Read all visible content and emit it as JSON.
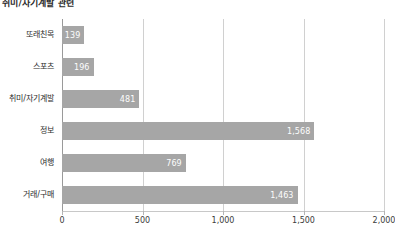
{
  "title": "취미/자기계발 관련",
  "chart_data": {
    "type": "bar",
    "orientation": "horizontal",
    "title": "취미/자기계발 관련",
    "xlabel": "",
    "ylabel": "",
    "categories": [
      "또래친목",
      "스포츠",
      "취미/자기계발",
      "정보",
      "여행",
      "거래/구매"
    ],
    "values": [
      139,
      196,
      481,
      1568,
      769,
      1463
    ],
    "value_labels": [
      "139",
      "196",
      "481",
      "1,568",
      "769",
      "1,463"
    ],
    "xlim": [
      0,
      2000
    ],
    "xticks": [
      0,
      500,
      1000,
      1500,
      2000
    ],
    "xtick_labels": [
      "0",
      "500",
      "1,000",
      "1,500",
      "2,000"
    ],
    "grid": true,
    "legend": false,
    "bar_color": "#a6a6a6",
    "value_label_color": "#fdfdfd",
    "gridline_color": "#d0d0d0",
    "axis_color": "#9a9a9a"
  }
}
